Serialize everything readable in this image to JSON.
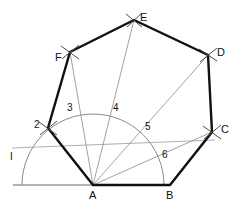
{
  "figure": {
    "canvas": {
      "width": 241,
      "height": 212
    },
    "colors": {
      "polygon_stroke": "#111111",
      "construction_stroke": "#8a8a8a",
      "baseline_stroke": "#9a9a9a",
      "arc_stroke": "#8a8a8a",
      "tick_stroke": "#5a5a5a",
      "label_color": "#111111",
      "background": "#ffffff"
    },
    "stroke_widths": {
      "polygon": 2.4,
      "construction": 0.8,
      "baseline": 1.6,
      "arc": 1.0,
      "tick": 1.0
    }
  },
  "points": {
    "A": {
      "x": 93,
      "y": 185,
      "label": "A",
      "label_x": 89,
      "label_y": 196
    },
    "B": {
      "x": 170,
      "y": 185,
      "label": "B",
      "label_x": 166,
      "label_y": 196
    },
    "C": {
      "x": 212,
      "y": 132,
      "label": "C",
      "label_x": 221,
      "label_y": 129
    },
    "D": {
      "x": 208,
      "y": 55,
      "label": "D",
      "label_x": 218,
      "label_y": 52
    },
    "E": {
      "x": 134,
      "y": 20,
      "label": "E",
      "label_x": 141,
      "label_y": 18
    },
    "F": {
      "x": 70,
      "y": 52,
      "label": "F",
      "label_x": 56,
      "label_y": 57
    },
    "G": {
      "x": 48,
      "y": 128,
      "label": "2",
      "label_x": 36,
      "label_y": 126
    }
  },
  "divisions": [
    {
      "id": "2",
      "label": "2",
      "x": 48,
      "y": 128,
      "label_x": 36,
      "label_y": 126
    },
    {
      "id": "3",
      "label": "3",
      "x": 66,
      "y": 114,
      "label_x": 68,
      "label_y": 108
    },
    {
      "id": "4",
      "label": "4",
      "x": 112,
      "y": 114,
      "label_x": 114,
      "label_y": 108
    },
    {
      "id": "5",
      "label": "5",
      "x": 144,
      "y": 133,
      "label_x": 146,
      "label_y": 127
    },
    {
      "id": "6",
      "label": "6",
      "x": 160,
      "y": 162,
      "label_x": 163,
      "label_y": 155
    }
  ],
  "aux": {
    "i_label": "I",
    "i_label_x": 11,
    "i_label_y": 156
  },
  "semicircle": {
    "center_x": 93,
    "center_y": 185,
    "radius": 71,
    "start_x": 22,
    "start_y": 185,
    "end_x": 164,
    "end_y": 185
  },
  "baseline": {
    "x1": 13,
    "y1": 185,
    "x2": 93,
    "y2": 185
  },
  "polygon_order": [
    "A",
    "B",
    "C",
    "D",
    "E",
    "F",
    "G"
  ],
  "rays_from_A": [
    {
      "to": "2",
      "x": 48,
      "y": 128
    },
    {
      "to": "F",
      "x": 70,
      "y": 52
    },
    {
      "to": "E",
      "x": 134,
      "y": 20
    },
    {
      "to": "D",
      "x": 208,
      "y": 55
    },
    {
      "to": "C",
      "x": 212,
      "y": 132
    }
  ],
  "construction_chords": [
    {
      "from": "F",
      "to": "E"
    },
    {
      "from": "E",
      "to": "D"
    },
    {
      "from": "D",
      "to": "C"
    }
  ],
  "i_line": {
    "x1": 12,
    "y1": 148,
    "x2": 215,
    "y2": 140
  },
  "arc_ticks": [
    {
      "at": "C",
      "x": 212,
      "y": 132
    },
    {
      "at": "D",
      "x": 208,
      "y": 55
    },
    {
      "at": "E",
      "x": 134,
      "y": 20
    },
    {
      "at": "F",
      "x": 70,
      "y": 52
    },
    {
      "at": "G",
      "x": 48,
      "y": 128
    }
  ]
}
